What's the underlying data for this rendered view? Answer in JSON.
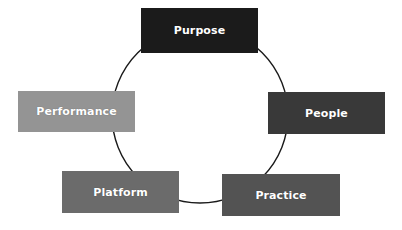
{
  "diagram": {
    "type": "cycle",
    "shape": "ring",
    "background_color": "#ffffff",
    "ring": {
      "stroke_color": "#1a1a1a",
      "stroke_width": 1.4,
      "center_x": 200,
      "center_y": 115,
      "radius": 88,
      "fill": "none"
    },
    "nodes": [
      {
        "id": "purpose",
        "label": "Purpose",
        "color": "#1b1b1b",
        "text_color": "#ffffff",
        "position": "top",
        "x": 141,
        "y": 8,
        "width": 117,
        "height": 45
      },
      {
        "id": "people",
        "label": "People",
        "color": "#393939",
        "text_color": "#ffffff",
        "position": "right",
        "x": 268,
        "y": 92,
        "width": 117,
        "height": 42
      },
      {
        "id": "practice",
        "label": "Practice",
        "color": "#535353",
        "text_color": "#ffffff",
        "position": "bottom-right",
        "x": 222,
        "y": 174,
        "width": 118,
        "height": 42
      },
      {
        "id": "platform",
        "label": "Platform",
        "color": "#6b6b6b",
        "text_color": "#ffffff",
        "position": "bottom-left",
        "x": 62,
        "y": 171,
        "width": 117,
        "height": 42
      },
      {
        "id": "performance",
        "label": "Performance",
        "color": "#949494",
        "text_color": "#ffffff",
        "position": "left",
        "x": 18,
        "y": 91,
        "width": 117,
        "height": 41
      }
    ]
  }
}
